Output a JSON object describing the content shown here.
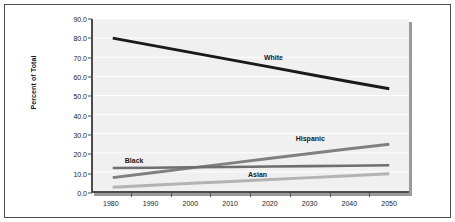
{
  "chart_data": {
    "type": "line",
    "title": "",
    "subtitle": "",
    "xlabel": "",
    "ylabel": "Percent of Total",
    "x": [
      1980,
      1990,
      2000,
      2010,
      2020,
      2030,
      2040,
      2050
    ],
    "xtick_labels": [
      "1980",
      "1990",
      "2000",
      "2010",
      "2020",
      "2030",
      "2040",
      "2050"
    ],
    "xlim": [
      1975,
      2055
    ],
    "ylim": [
      0.0,
      90.0
    ],
    "ytick_labels": [
      "0.0",
      "10.0",
      "20.0",
      "30.0",
      "40.0",
      "50.0",
      "60.0",
      "70.0",
      "80.0",
      "90.0"
    ],
    "ytick_values": [
      0.0,
      10.0,
      20.0,
      30.0,
      40.0,
      50.0,
      60.0,
      70.0,
      80.0,
      90.0
    ],
    "grid": true,
    "grid_orientation": "horizontal",
    "grid_color": "#ffffff",
    "plot_background": "#f0f0f0",
    "legend_position": "inline-annotations",
    "series": [
      {
        "name": "White",
        "color": "#1a1a1a",
        "width": 3.0,
        "values": [
          80.0,
          76.2,
          72.4,
          68.6,
          64.8,
          61.0,
          57.2,
          53.5
        ],
        "label_x": 2018,
        "label_y": 69.5
      },
      {
        "name": "Hispanic",
        "color": "#808080",
        "width": 3.0,
        "values": [
          7.0,
          9.5,
          12.1,
          14.6,
          17.1,
          19.6,
          22.1,
          24.5
        ],
        "label_x": 2026,
        "label_y": 27.5
      },
      {
        "name": "Black",
        "color": "#6e6e6e",
        "width": 2.6,
        "values": [
          12.0,
          12.2,
          12.4,
          12.6,
          12.8,
          13.0,
          13.2,
          13.5
        ],
        "label_x": 1983,
        "label_y": 15.8
      },
      {
        "name": "Asian",
        "color": "#b3b3b3",
        "width": 3.0,
        "values": [
          2.0,
          3.0,
          4.0,
          5.0,
          6.0,
          7.0,
          8.0,
          9.0
        ],
        "label_x": 2014,
        "label_y": 8.6
      }
    ]
  }
}
